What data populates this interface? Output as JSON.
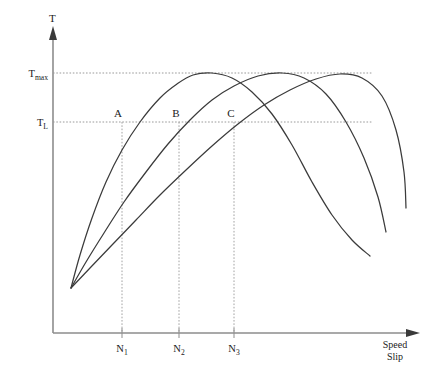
{
  "figure": {
    "title_y_axis": "T",
    "x_axis_name_line1": "Speed",
    "x_axis_name_line2": "Slip",
    "background": "#ffffff",
    "curve_color": "#3b3b3b",
    "axis_color": "#8d8d8d",
    "guide_color": "#9a9a9a"
  },
  "y_ticks": [
    {
      "base": "T",
      "sub": "max",
      "value_label": "Tmax",
      "y": 73
    },
    {
      "base": "T",
      "sub": "L",
      "value_label": "TL",
      "y": 122
    }
  ],
  "x_ticks": [
    {
      "base": "N",
      "sub": "1",
      "value_label": "N1",
      "x": 122
    },
    {
      "base": "N",
      "sub": "2",
      "value_label": "N2",
      "x": 179
    },
    {
      "base": "N",
      "sub": "3",
      "value_label": "N3",
      "x": 234
    }
  ],
  "operating_points": [
    {
      "label": "A",
      "x": 122,
      "y": 122
    },
    {
      "label": "B",
      "x": 179,
      "y": 122
    },
    {
      "label": "C",
      "x": 234,
      "y": 122
    }
  ],
  "chart_data": {
    "type": "line",
    "title": "",
    "xlabel": "Speed / Slip",
    "ylabel": "T",
    "xlim": [
      53,
      420
    ],
    "ylim": [
      333,
      60
    ],
    "grid": false,
    "legend": "none",
    "axis_tick_labels": {
      "y": [
        "Tmax",
        "TL"
      ],
      "x": [
        "N1",
        "N2",
        "N3"
      ]
    },
    "annotations": [
      "A",
      "B",
      "C"
    ],
    "series": [
      {
        "name": "curve-1",
        "comment": "left-most torque-speed curve, peaks at Tmax",
        "points": [
          [
            71,
            288
          ],
          [
            80,
            255
          ],
          [
            92,
            218
          ],
          [
            106,
            182
          ],
          [
            122,
            150
          ],
          [
            140,
            122
          ],
          [
            160,
            98
          ],
          [
            177,
            84
          ],
          [
            193,
            75
          ],
          [
            212,
            73
          ],
          [
            232,
            78
          ],
          [
            252,
            92
          ],
          [
            272,
            114
          ],
          [
            292,
            145
          ],
          [
            312,
            182
          ],
          [
            332,
            215
          ],
          [
            352,
            240
          ],
          [
            370,
            256
          ]
        ]
      },
      {
        "name": "curve-2",
        "comment": "middle torque-speed curve, shifted right",
        "points": [
          [
            71,
            288
          ],
          [
            86,
            262
          ],
          [
            104,
            233
          ],
          [
            124,
            202
          ],
          [
            146,
            172
          ],
          [
            168,
            144
          ],
          [
            190,
            120
          ],
          [
            212,
            100
          ],
          [
            234,
            86
          ],
          [
            258,
            76
          ],
          [
            282,
            73
          ],
          [
            304,
            78
          ],
          [
            326,
            94
          ],
          [
            346,
            122
          ],
          [
            364,
            158
          ],
          [
            378,
            197
          ],
          [
            386,
            232
          ]
        ]
      },
      {
        "name": "curve-3",
        "comment": "right-most torque-speed curve, shifted furthest right",
        "points": [
          [
            71,
            288
          ],
          [
            90,
            268
          ],
          [
            112,
            245
          ],
          [
            136,
            220
          ],
          [
            160,
            195
          ],
          [
            186,
            170
          ],
          [
            212,
            146
          ],
          [
            238,
            124
          ],
          [
            264,
            105
          ],
          [
            290,
            90
          ],
          [
            316,
            79
          ],
          [
            340,
            74
          ],
          [
            362,
            78
          ],
          [
            382,
            96
          ],
          [
            396,
            130
          ],
          [
            404,
            172
          ],
          [
            406,
            208
          ]
        ]
      }
    ]
  }
}
